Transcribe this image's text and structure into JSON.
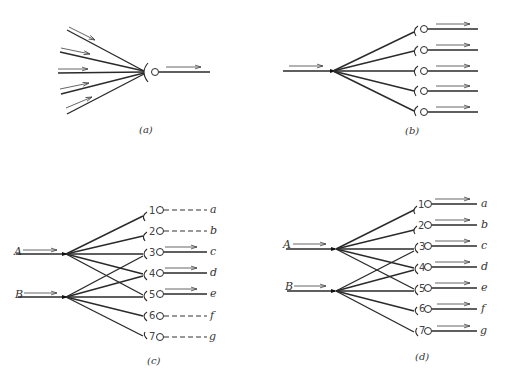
{
  "panels": {
    "a": {
      "caption": "(a)",
      "description": "Convergence: five input fibers converge onto one neuron with a single output"
    },
    "b": {
      "caption": "(b)",
      "description": "Divergence: one input fiber diverges onto five neurons each with an output"
    },
    "c": {
      "caption": "(c)",
      "inputs": [
        "A",
        "B"
      ],
      "neurons": [
        "1",
        "2",
        "3",
        "4",
        "5",
        "6",
        "7"
      ],
      "outputs": [
        "a",
        "b",
        "c",
        "d",
        "e",
        "f",
        "g"
      ],
      "active_outputs": [
        "c",
        "d",
        "e"
      ],
      "inactive_outputs": [
        "a",
        "b",
        "f",
        "g"
      ]
    },
    "d": {
      "caption": "(d)",
      "inputs": [
        "A",
        "B"
      ],
      "neurons": [
        "1",
        "2",
        "3",
        "4",
        "5",
        "6",
        "7"
      ],
      "outputs": [
        "a",
        "b",
        "c",
        "d",
        "e",
        "f",
        "g"
      ],
      "active_outputs": [
        "a",
        "b",
        "c",
        "d",
        "e",
        "f",
        "g"
      ]
    }
  }
}
